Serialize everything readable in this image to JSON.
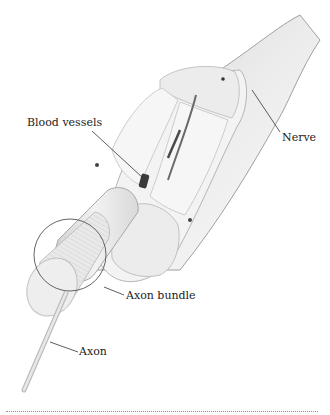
{
  "figure": {
    "type": "anatomical-diagram"
  },
  "labels": {
    "blood_vessels": "Blood vessels",
    "nerve": "Nerve",
    "axon_bundle": "Axon bundle",
    "axon": "Axon"
  },
  "colors": {
    "background": "#ffffff",
    "tissue_light": "#f1f1f1",
    "tissue_mid": "#dedede",
    "outline": "#9a9a9a",
    "vessel": "#3a3a3a",
    "leader_line": "#333333"
  }
}
